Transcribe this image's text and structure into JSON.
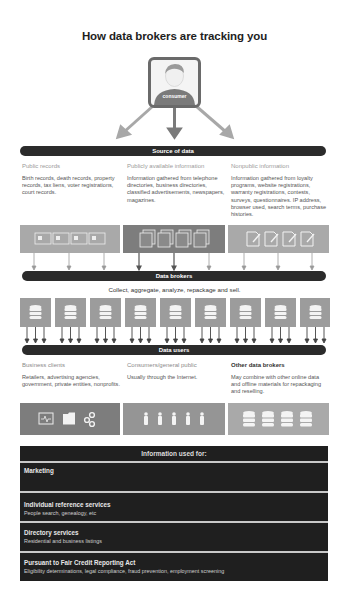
{
  "title": "How data brokers are tracking you",
  "consumer": {
    "label": "consumer",
    "icon": "person-icon"
  },
  "source_bar": {
    "label": "Source of data"
  },
  "sources": [
    {
      "header": "Public records",
      "description": "Birth records, death records, property records, tax liens, voter registrations, court records.",
      "icon": "id-card-icon"
    },
    {
      "header": "Publicly available information",
      "description": "Information gathered from telephone directories, business directories, classified advertisements, newspapers, magazines.",
      "icon": "stacked-documents-icon"
    },
    {
      "header": "Nonpublic information",
      "description": "Information gathered from loyalty programs, website registrations, warranty registrations, contests, surveys, questionnaires. IP address, browser used, search terms, purchase histories.",
      "icon": "form-pencil-icon"
    }
  ],
  "brokers_bar": {
    "label": "Data brokers"
  },
  "brokers_caption": "Collect, aggregate, analyze, repackage and sell.",
  "broker_count": 9,
  "users_bar": {
    "label": "Data users"
  },
  "users": [
    {
      "header": "Business clients",
      "description": "Retailers, advertising agencies, government, private entities, nonprofits.",
      "icons": [
        "monitor-pulse-icon",
        "folder-icon",
        "gears-icon"
      ]
    },
    {
      "header": "Consumers/general public",
      "description": "Usually through the Internet.",
      "icons": [
        "person-icon",
        "person-icon",
        "person-icon",
        "person-icon",
        "person-icon"
      ]
    },
    {
      "header": "Other data brokers",
      "description": "May combine with other online data and offline materials for repackaging and reselling.",
      "icons": [
        "database-icon",
        "database-icon",
        "database-icon",
        "database-icon"
      ]
    }
  ],
  "info_table": {
    "header": "Information used for:",
    "rows": [
      {
        "title": "Marketing",
        "subtitle": ""
      },
      {
        "title": "Individual reference services",
        "subtitle": "People search, genealogy, etc"
      },
      {
        "title": "Directory services",
        "subtitle": "Residential and business listings"
      },
      {
        "title": "Pursuant to Fair Credit Reporting Act",
        "subtitle": "Eligibility determinations, legal compliance, fraud prevention, employment screening"
      }
    ]
  },
  "colors": {
    "dark_bar": "#2b2b2b",
    "panel_light": "#a9a9a9",
    "panel_dark": "#7d7d7d",
    "table_bg": "#1f1f1f"
  }
}
